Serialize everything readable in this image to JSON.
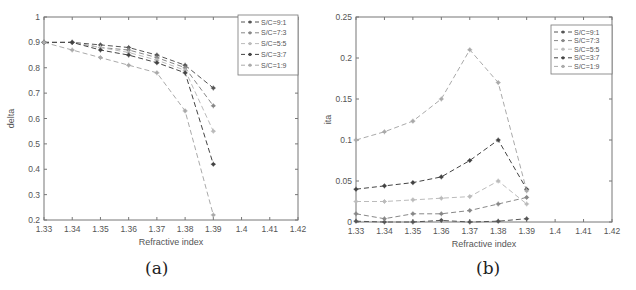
{
  "chart_data": [
    {
      "id": "a",
      "type": "line",
      "caption": "(a)",
      "title": "",
      "xlabel": "Refractive index",
      "ylabel": "delta",
      "xlim": [
        1.33,
        1.42
      ],
      "ylim": [
        0.2,
        1.0
      ],
      "xticks": [
        1.33,
        1.34,
        1.35,
        1.36,
        1.37,
        1.38,
        1.39,
        1.4,
        1.41,
        1.42
      ],
      "xtick_labels": [
        "1.33",
        "1.34",
        "1.35",
        "1.36",
        "1.37",
        "1.38",
        "1.39",
        "1.4",
        "1.41",
        "1.42"
      ],
      "yticks": [
        0.2,
        0.3,
        0.4,
        0.5,
        0.6,
        0.7,
        0.8,
        0.9,
        1.0
      ],
      "ytick_labels": [
        "0.2",
        "0.3",
        "0.4",
        "0.5",
        "0.6",
        "0.7",
        "0.8",
        "0.9",
        "1"
      ],
      "grid": false,
      "legend_position": "upper right",
      "x": [
        1.33,
        1.34,
        1.35,
        1.36,
        1.37,
        1.38,
        1.39
      ],
      "series": [
        {
          "name": "S/C=9:1",
          "color": "#555555",
          "values": [
            0.9,
            0.9,
            0.89,
            0.88,
            0.85,
            0.81,
            0.72
          ]
        },
        {
          "name": "S/C=7:3",
          "color": "#888888",
          "values": [
            0.9,
            0.9,
            0.88,
            0.87,
            0.84,
            0.8,
            0.65
          ]
        },
        {
          "name": "S/C=5:5",
          "color": "#bbbbbb",
          "values": [
            0.9,
            0.9,
            0.88,
            0.86,
            0.83,
            0.79,
            0.55
          ]
        },
        {
          "name": "S/C=3:7",
          "color": "#444444",
          "values": [
            0.9,
            0.9,
            0.87,
            0.85,
            0.82,
            0.78,
            0.42
          ]
        },
        {
          "name": "S/C=1:9",
          "color": "#aaaaaa",
          "values": [
            0.9,
            0.87,
            0.84,
            0.81,
            0.78,
            0.63,
            0.22
          ]
        }
      ]
    },
    {
      "id": "b",
      "type": "line",
      "caption": "(b)",
      "title": "",
      "xlabel": "Refractive index",
      "ylabel": "ita",
      "xlim": [
        1.33,
        1.42
      ],
      "ylim": [
        0,
        0.25
      ],
      "xticks": [
        1.33,
        1.34,
        1.35,
        1.36,
        1.37,
        1.38,
        1.39,
        1.4,
        1.41,
        1.42
      ],
      "xtick_labels": [
        "1.33",
        "1.34",
        "1.35",
        "1.36",
        "1.37",
        "1.38",
        "1.39",
        "1.4",
        "1.41",
        "1.42"
      ],
      "yticks": [
        0,
        0.05,
        0.1,
        0.15,
        0.2,
        0.25
      ],
      "ytick_labels": [
        "0",
        "0.05",
        "0.1",
        "0.15",
        "0.2",
        "0.25"
      ],
      "grid": false,
      "legend_position": "upper right",
      "x": [
        1.33,
        1.34,
        1.35,
        1.36,
        1.37,
        1.38,
        1.39
      ],
      "series": [
        {
          "name": "S/C=9:1",
          "color": "#555555",
          "values": [
            0.001,
            0.0,
            0.0,
            0.002,
            0.0,
            0.001,
            0.004
          ]
        },
        {
          "name": "S/C=7:3",
          "color": "#888888",
          "values": [
            0.01,
            0.004,
            0.01,
            0.01,
            0.014,
            0.022,
            0.03
          ]
        },
        {
          "name": "S/C=5:5",
          "color": "#bbbbbb",
          "values": [
            0.025,
            0.025,
            0.027,
            0.029,
            0.031,
            0.05,
            0.022
          ]
        },
        {
          "name": "S/C=3:7",
          "color": "#444444",
          "values": [
            0.04,
            0.044,
            0.048,
            0.055,
            0.075,
            0.1,
            0.04
          ]
        },
        {
          "name": "S/C=1:9",
          "color": "#aaaaaa",
          "values": [
            0.1,
            0.11,
            0.123,
            0.15,
            0.21,
            0.17,
            0.038
          ]
        }
      ]
    }
  ]
}
